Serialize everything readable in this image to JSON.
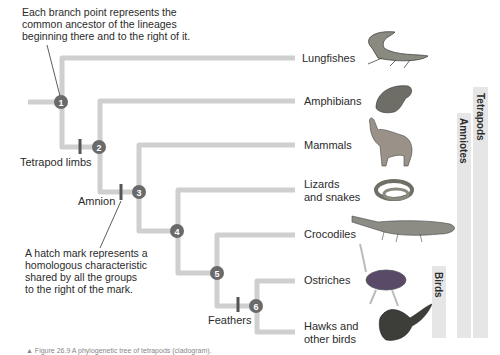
{
  "annotations": {
    "branch_point_note": [
      "Each branch point represents the",
      "common ancestor of the lineages",
      "beginning there and to the right of it."
    ],
    "hatch_mark_note": [
      "A hatch mark represents a",
      "homologous characteristic",
      "shared by all the groups",
      "to the right of the mark."
    ]
  },
  "traits": {
    "tetrapod_limbs": "Tetrapod limbs",
    "amnion": "Amnion",
    "feathers": "Feathers"
  },
  "nodes": [
    "1",
    "2",
    "3",
    "4",
    "5",
    "6"
  ],
  "taxa": [
    {
      "label": "Lungfishes",
      "icon": "lungfish-illustration"
    },
    {
      "label": "Amphibians",
      "icon": "frog-illustration"
    },
    {
      "label": "Mammals",
      "icon": "wolf-illustration"
    },
    {
      "label_lines": [
        "Lizards",
        "and snakes"
      ],
      "icon": "snake-illustration"
    },
    {
      "label": "Crocodiles",
      "icon": "crocodile-illustration"
    },
    {
      "label": "Ostriches",
      "icon": "ostrich-illustration"
    },
    {
      "label_lines": [
        "Hawks and",
        "other birds"
      ],
      "icon": "hawk-illustration"
    }
  ],
  "clades": {
    "tetrapods": "Tetrapods",
    "amniotes": "Amniotes",
    "birds": "Birds"
  },
  "caption": "▲ Figure 26.9  A phylogenetic tree of tetrapods (cladogram)."
}
